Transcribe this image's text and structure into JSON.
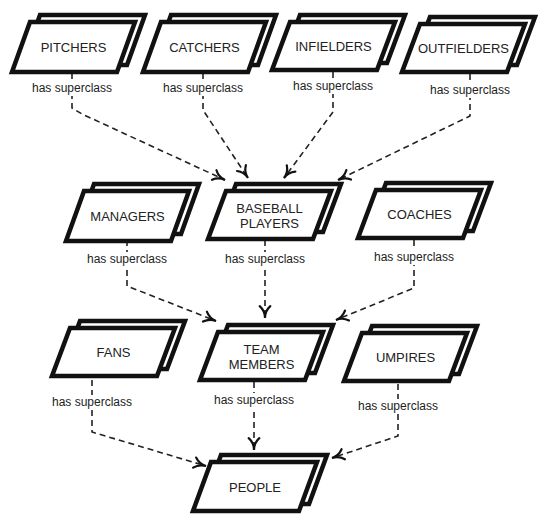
{
  "diagram": {
    "title": "",
    "relation_label": "has superclass",
    "nodes": [
      {
        "id": "pitchers",
        "lines": [
          "PITCHERS"
        ],
        "x": 30,
        "y": 22,
        "w": 105,
        "h": 50
      },
      {
        "id": "catchers",
        "lines": [
          "CATCHERS"
        ],
        "x": 161,
        "y": 22,
        "w": 105,
        "h": 50
      },
      {
        "id": "infielders",
        "lines": [
          "INFIELDERS"
        ],
        "x": 290,
        "y": 22,
        "w": 105,
        "h": 48
      },
      {
        "id": "outfielders",
        "lines": [
          "OUTFIELDERS"
        ],
        "x": 420,
        "y": 24,
        "w": 105,
        "h": 48
      },
      {
        "id": "managers",
        "lines": [
          "MANAGERS"
        ],
        "x": 84,
        "y": 191,
        "w": 105,
        "h": 50
      },
      {
        "id": "baseball_players",
        "lines": [
          "BASEBALL",
          "PLAYERS"
        ],
        "x": 226,
        "y": 191,
        "w": 105,
        "h": 48
      },
      {
        "id": "coaches",
        "lines": [
          "COACHES"
        ],
        "x": 376,
        "y": 190,
        "w": 105,
        "h": 48
      },
      {
        "id": "fans",
        "lines": [
          "FANS"
        ],
        "x": 70,
        "y": 328,
        "w": 105,
        "h": 48
      },
      {
        "id": "team_members",
        "lines": [
          "TEAM",
          "MEMBERS"
        ],
        "x": 218,
        "y": 332,
        "w": 105,
        "h": 48
      },
      {
        "id": "umpires",
        "lines": [
          "UMPIRES"
        ],
        "x": 362,
        "y": 333,
        "w": 105,
        "h": 48
      },
      {
        "id": "people",
        "lines": [
          "PEOPLE"
        ],
        "x": 211,
        "y": 462,
        "w": 106,
        "h": 49
      }
    ],
    "edges": [
      {
        "from": "pitchers",
        "to": "baseball_players",
        "label": "has superclass",
        "label_pos": [
          72,
          92
        ],
        "points": [
          [
            72,
            73
          ],
          [
            72,
            108
          ],
          [
            82,
            114
          ],
          [
            225,
            180
          ]
        ]
      },
      {
        "from": "catchers",
        "to": "baseball_players",
        "label": "has superclass",
        "label_pos": [
          203,
          92
        ],
        "points": [
          [
            203,
            73
          ],
          [
            203,
            110
          ],
          [
            248,
            178
          ]
        ]
      },
      {
        "from": "infielders",
        "to": "baseball_players",
        "label": "has superclass",
        "label_pos": [
          333,
          90
        ],
        "points": [
          [
            333,
            72
          ],
          [
            333,
            112
          ],
          [
            284,
            178
          ]
        ]
      },
      {
        "from": "outfielders",
        "to": "baseball_players",
        "label": "has superclass",
        "label_pos": [
          470,
          94
        ],
        "points": [
          [
            470,
            74
          ],
          [
            470,
            116
          ],
          [
            338,
            180
          ]
        ]
      },
      {
        "from": "managers",
        "to": "team_members",
        "label": "has superclass",
        "label_pos": [
          127,
          263
        ],
        "points": [
          [
            127,
            240
          ],
          [
            127,
            286
          ],
          [
            216,
            321
          ]
        ]
      },
      {
        "from": "baseball_players",
        "to": "team_members",
        "label": "has superclass",
        "label_pos": [
          265,
          263
        ],
        "points": [
          [
            265,
            240
          ],
          [
            265,
            318
          ]
        ]
      },
      {
        "from": "coaches",
        "to": "team_members",
        "label": "has superclass",
        "label_pos": [
          414,
          261
        ],
        "points": [
          [
            414,
            240
          ],
          [
            414,
            288
          ],
          [
            336,
            320
          ]
        ]
      },
      {
        "from": "fans",
        "to": "people",
        "label": "has superclass",
        "label_pos": [
          92,
          406
        ],
        "points": [
          [
            92,
            380
          ],
          [
            92,
            432
          ],
          [
            206,
            466
          ]
        ]
      },
      {
        "from": "team_members",
        "to": "people",
        "label": "has superclass",
        "label_pos": [
          254,
          404
        ],
        "points": [
          [
            254,
            382
          ],
          [
            254,
            450
          ]
        ]
      },
      {
        "from": "umpires",
        "to": "people",
        "label": "has superclass",
        "label_pos": [
          398,
          410
        ],
        "points": [
          [
            398,
            384
          ],
          [
            398,
            436
          ],
          [
            332,
            458
          ]
        ]
      }
    ]
  }
}
